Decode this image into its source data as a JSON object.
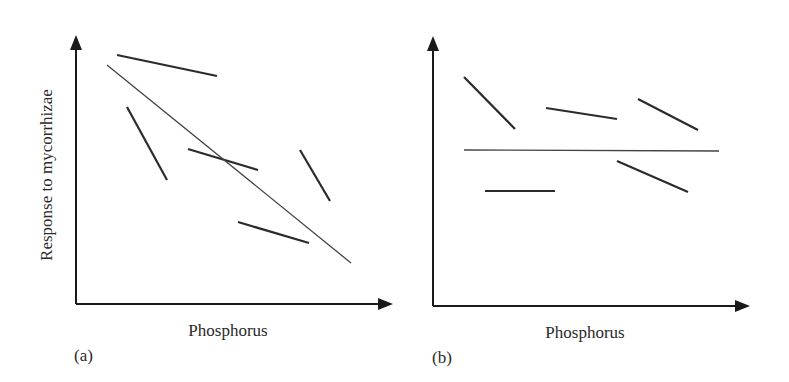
{
  "figure": {
    "panels": [
      {
        "id": "a",
        "label": "(a)",
        "xlabel": "Phosphorus",
        "ylabel": "Response to mycorrhizae",
        "regression_line": {
          "x1": 107,
          "y1": 65,
          "x2": 351,
          "y2": 263
        },
        "segments": [
          {
            "x1": 117,
            "y1": 55,
            "x2": 217,
            "y2": 76
          },
          {
            "x1": 127,
            "y1": 107,
            "x2": 167,
            "y2": 180
          },
          {
            "x1": 188,
            "y1": 149,
            "x2": 258,
            "y2": 170
          },
          {
            "x1": 300,
            "y1": 150,
            "x2": 330,
            "y2": 201
          },
          {
            "x1": 238,
            "y1": 222,
            "x2": 309,
            "y2": 243
          }
        ]
      },
      {
        "id": "b",
        "label": "(b)",
        "xlabel": "Phosphorus",
        "ylabel": "",
        "regression_line": {
          "x1": 464,
          "y1": 150,
          "x2": 719,
          "y2": 151
        },
        "segments": [
          {
            "x1": 464,
            "y1": 77,
            "x2": 515,
            "y2": 129
          },
          {
            "x1": 546,
            "y1": 108,
            "x2": 617,
            "y2": 119
          },
          {
            "x1": 638,
            "y1": 99,
            "x2": 698,
            "y2": 130
          },
          {
            "x1": 617,
            "y1": 161,
            "x2": 688,
            "y2": 192
          },
          {
            "x1": 485,
            "y1": 191,
            "x2": 555,
            "y2": 191
          }
        ]
      }
    ],
    "colors": {
      "axis": "#1a1a1a",
      "segment": "#2b2b2b",
      "regression": "#444444"
    }
  }
}
